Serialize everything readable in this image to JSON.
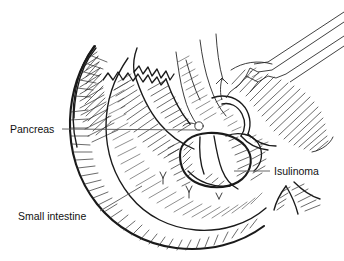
{
  "figure": {
    "type": "medical-line-illustration",
    "background_color": "#ffffff",
    "ink_color": "#1a1a1a",
    "leader_line_color": "#555555",
    "width": 344,
    "height": 261
  },
  "labels": [
    {
      "id": "pancreas",
      "text": "Pancreas",
      "text_x": 10,
      "text_y": 133,
      "leader": {
        "x1": 62,
        "y1": 129,
        "x2": 200,
        "y2": 130
      }
    },
    {
      "id": "isulinoma",
      "text": "Isulinoma",
      "text_x": 274,
      "text_y": 173,
      "leader": {
        "x1": 234,
        "y1": 171,
        "x2": 270,
        "y2": 171
      }
    },
    {
      "id": "small-intestine",
      "text": "Small intestine",
      "text_x": 18,
      "text_y": 220,
      "leader": {
        "x1": 100,
        "y1": 211,
        "x2": 142,
        "y2": 186
      }
    }
  ],
  "anatomy": [
    {
      "id": "pancreas-body",
      "name": "Pancreas body and tail"
    },
    {
      "id": "pancreas-lobules",
      "name": "Lobulated pancreatic surface"
    },
    {
      "id": "insulinoma-mass",
      "name": "Insulinoma tumor mass"
    },
    {
      "id": "duodenum-small-intestine",
      "name": "Duodenum / small intestine loop"
    },
    {
      "id": "retroperitoneal-tissue",
      "name": "Surrounding retroperitoneal tissue"
    },
    {
      "id": "vessel-loop",
      "name": "Vascular structure"
    },
    {
      "id": "suture-marks",
      "name": "Suture / vessel tie markers"
    }
  ],
  "instruments": [
    {
      "id": "forceps",
      "name": "Surgical forceps"
    },
    {
      "id": "retractor-tip",
      "name": "Instrument tip"
    }
  ]
}
